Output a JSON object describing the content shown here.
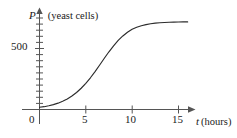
{
  "chart_data": {
    "type": "line",
    "title": "",
    "xlabel": "t (hours)",
    "ylabel": "P (yeast cells)",
    "x_var": "t",
    "x_unit": "(hours)",
    "y_var": "P",
    "y_unit": "(yeast cells)",
    "xlim": [
      0,
      16.5
    ],
    "ylim": [
      0,
      800
    ],
    "grid": false,
    "legend": null,
    "x_ticks": [
      5,
      10,
      15
    ],
    "x_tick_labels": [
      "5",
      "10",
      "15"
    ],
    "x_minor_ticks": [],
    "y_ticks": [
      500
    ],
    "y_tick_labels": [
      "500"
    ],
    "y_minor_ticks": [
      50,
      100,
      150,
      200,
      250,
      300,
      350,
      400,
      450,
      550,
      600,
      650,
      700
    ],
    "origin_label": "0",
    "series": [
      {
        "name": "yeast population",
        "curve": "logistic",
        "carrying_capacity": 700,
        "inflection_x": 7,
        "growth_rate": 0.55,
        "initial_value": 18,
        "x": [
          0,
          0.5,
          1,
          1.5,
          2,
          2.5,
          3,
          3.5,
          4,
          4.5,
          5,
          5.5,
          6,
          6.5,
          7,
          7.5,
          8,
          8.5,
          9,
          9.5,
          10,
          10.5,
          11,
          11.5,
          12,
          12.5,
          13,
          13.5,
          14,
          14.5,
          15,
          15.5,
          16
        ],
        "y": [
          18,
          23,
          31,
          40,
          52,
          67,
          86,
          110,
          139,
          174,
          214,
          260,
          311,
          365,
          420,
          473,
          522,
          566,
          603,
          633,
          657,
          674,
          687,
          696,
          703,
          708,
          711,
          713,
          715,
          716,
          717,
          718,
          718
        ]
      }
    ]
  },
  "labels": {
    "y_axis_title_var": "P",
    "y_axis_title_unit": "(yeast cells)",
    "x_axis_title_var": "t",
    "x_axis_title_unit": "(hours)",
    "y_tick_500": "500",
    "x_tick_0": "0",
    "x_tick_5": "5",
    "x_tick_10": "10",
    "x_tick_15": "15"
  },
  "style": {
    "curve_color": "#2b2b2b",
    "axis_color": "#4d4d4d",
    "text_color": "#1a1a1a",
    "background": "#ffffff"
  }
}
